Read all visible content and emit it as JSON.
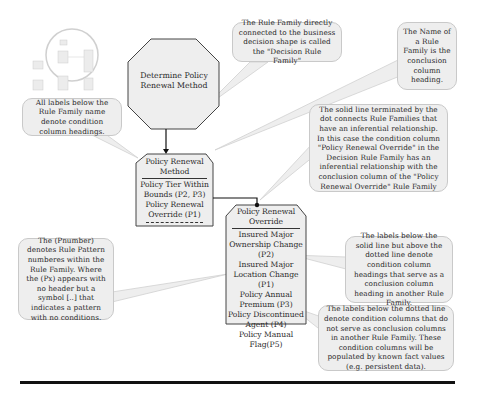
{
  "thumbnail": {
    "description": "miniature overview of full decision model with circled focus area"
  },
  "decision": {
    "label": "Determine Policy Renewal Method",
    "shape": "octagon"
  },
  "rule_families": [
    {
      "name": "Policy Renewal Method",
      "conditions_inferred": [
        "Policy Tier Within Bounds (P2, P3)",
        "Policy Renewal Override (P1)"
      ],
      "conditions_fact": [],
      "dotted_marker": "-----------"
    },
    {
      "name": "Policy Renewal Override",
      "conditions_inferred": [],
      "conditions_fact": [
        "Insured Major Ownership Change (P2)",
        "Insured Major Location Change (P1)",
        "Policy Annual Premium (P3)",
        "Policy Discontinued Agent (P4)",
        "Policy Manual Flag(P5)"
      ]
    }
  ],
  "callouts": {
    "labels_below": "All labels below the Rule Family name denote condition column headings.",
    "decision_rule_family": "The Rule Family directly connected to the business decision shape is called the \"Decision Rule Family\"",
    "name_conclusion": "The Name of a Rule Family is the conclusion column heading.",
    "solid_line": "The solid line terminated by the dot connects Rule Families that have an inferential relationship. In this case the condition column \"Policy Renewal Override\" in the Decision Rule Family has an inferential relationship with the conclusion column of the \"Policy Renewal Override\" Rule Family",
    "pnumber": "The (Pnumber) denotes Rule Pattern numberes within the Rule Family. Where the (Px) appears with no header but a symbol [..] that indicates a pattern with no conditions.",
    "above_dotted": "The labels below the solid line but above the dotted line denote condition column headings that serve as a conclusion column heading in another Rule Family.",
    "below_dotted": "The labels below the dotted line denote condition columns that do not serve as conclusion columns in another Rule Family. These condition columns will be populated by known fact values (e.g. persistent data)."
  },
  "colors": {
    "shape_fill": "#eeeeee",
    "shape_stroke": "#555555",
    "connector": "#111111"
  }
}
